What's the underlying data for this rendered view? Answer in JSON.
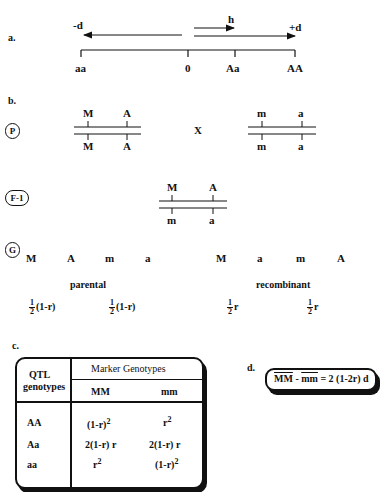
{
  "panels": {
    "a": {
      "label": "a.",
      "minus_d": "-d",
      "plus_d": "+d",
      "h": "h",
      "ticks": [
        "aa",
        "0",
        "Aa",
        "AA"
      ]
    },
    "b": {
      "label": "b.",
      "p_badge": "P",
      "f1_badge": "F-1",
      "g_badge": "G",
      "cross": "X",
      "parent1": {
        "top": [
          "M",
          "A"
        ],
        "bottom": [
          "M",
          "A"
        ]
      },
      "parent2": {
        "top": [
          "m",
          "a"
        ],
        "bottom": [
          "m",
          "a"
        ]
      },
      "f1": {
        "top": [
          "M",
          "A"
        ],
        "bottom": [
          "m",
          "a"
        ]
      },
      "gametes": [
        {
          "markers": [
            "M",
            "A"
          ],
          "freq_num": "1",
          "freq_den": "2",
          "freq_rest": "(1-r)"
        },
        {
          "markers": [
            "m",
            "a"
          ],
          "freq_num": "1",
          "freq_den": "2",
          "freq_rest": "(1-r)"
        },
        {
          "markers": [
            "M",
            "a"
          ],
          "freq_num": "1",
          "freq_den": "2",
          "freq_rest": "r"
        },
        {
          "markers": [
            "m",
            "A"
          ],
          "freq_num": "1",
          "freq_den": "2",
          "freq_rest": "r"
        }
      ],
      "parental_label": "parental",
      "recombinant_label": "recombinant"
    },
    "c": {
      "label": "c.",
      "row_header_line1": "QTL",
      "row_header_line2": "genotypes",
      "col_group_header": "Marker  Genotypes",
      "columns": [
        "MM",
        "mm"
      ],
      "rows": [
        {
          "qtl": "AA",
          "MM": "(1-r)",
          "MM_sup": "2",
          "mm": "r",
          "mm_sup": "2"
        },
        {
          "qtl": "Aa",
          "MM": "2(1-r) r",
          "MM_sup": "",
          "mm": "2(1-r) r",
          "mm_sup": ""
        },
        {
          "qtl": "aa",
          "MM": "r",
          "MM_sup": "2",
          "mm": "(1-r)",
          "mm_sup": "2"
        }
      ]
    },
    "d": {
      "label": "d.",
      "mm_upper": "MM",
      "minus": " - ",
      "mm_lower": "mm",
      "rhs": " = 2 (1-2r) d"
    }
  }
}
